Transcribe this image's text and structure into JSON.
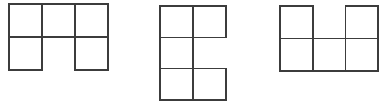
{
  "canvas": {
    "width": 385,
    "height": 109,
    "background_color": "#ffffff"
  },
  "style": {
    "stroke_color": "#3c3c3c",
    "stroke_width": 1.6,
    "cell_fill": "#ffffff"
  },
  "figures": [
    {
      "id": "figure-1",
      "name": "polyomino-figure-1",
      "shape_description": "Three squares in the top row with squares below the left and right columns; middle bottom cell empty",
      "cell_count": 5,
      "grid_columns": 3,
      "grid_rows": 2,
      "origin_x": 9,
      "origin_y": 4,
      "cell_width": 33,
      "cell_height": 33,
      "cells": [
        {
          "name": "cell-r0c0",
          "row": 0,
          "col": 0
        },
        {
          "name": "cell-r0c1",
          "row": 0,
          "col": 1
        },
        {
          "name": "cell-r0c2",
          "row": 0,
          "col": 2
        },
        {
          "name": "cell-r1c0",
          "row": 1,
          "col": 0
        },
        {
          "name": "cell-r1c2",
          "row": 1,
          "col": 2
        }
      ]
    },
    {
      "id": "figure-2",
      "name": "polyomino-figure-2",
      "shape_description": "Two squares top row, one square middle-left, two squares bottom row; middle-right cell empty forming an S/E shape",
      "cell_count": 5,
      "grid_columns": 2,
      "grid_rows": 3,
      "origin_x": 160,
      "origin_y": 6,
      "cell_width": 33,
      "cell_height": 31.3,
      "cells": [
        {
          "name": "cell-r0c0",
          "row": 0,
          "col": 0
        },
        {
          "name": "cell-r0c1",
          "row": 0,
          "col": 1
        },
        {
          "name": "cell-r1c0",
          "row": 1,
          "col": 0
        },
        {
          "name": "cell-r2c0",
          "row": 2,
          "col": 0
        },
        {
          "name": "cell-r2c1",
          "row": 2,
          "col": 1
        }
      ]
    },
    {
      "id": "figure-3",
      "name": "polyomino-figure-3",
      "shape_description": "U shape: squares at top left and top right with middle top empty, full bottom row of three squares",
      "cell_count": 5,
      "grid_columns": 3,
      "grid_rows": 2,
      "origin_x": 280,
      "origin_y": 6,
      "cell_width": 32.7,
      "cell_height": 32.5,
      "cells": [
        {
          "name": "cell-r0c0",
          "row": 0,
          "col": 0
        },
        {
          "name": "cell-r0c2",
          "row": 0,
          "col": 2
        },
        {
          "name": "cell-r1c0",
          "row": 1,
          "col": 0
        },
        {
          "name": "cell-r1c1",
          "row": 1,
          "col": 1
        },
        {
          "name": "cell-r1c2",
          "row": 1,
          "col": 2
        }
      ]
    }
  ]
}
